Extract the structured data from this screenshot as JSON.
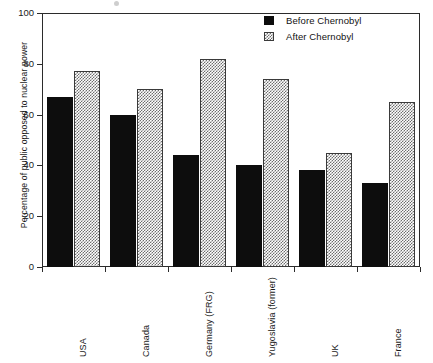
{
  "chart_data": {
    "type": "bar",
    "title": "",
    "xlabel": "",
    "ylabel": "Percentage of public opposed to nuclear power",
    "ylim": [
      0,
      100
    ],
    "yticks": [
      0,
      20,
      40,
      60,
      80,
      100
    ],
    "ytick_labels": [
      "0",
      "20",
      "40",
      "60",
      "80",
      "100"
    ],
    "grid": "horizontal dotted gridlines at 20, 40, 60, 80",
    "legend_position": "top-right inside plot area",
    "categories": [
      "USA",
      "Canada",
      "Germany (FRG)",
      "Yugoslavia (former)",
      "UK",
      "France"
    ],
    "series": [
      {
        "name": "Before Chernobyl",
        "fill": "solid-black",
        "color": "#0d0d0d",
        "values": [
          67,
          60,
          44,
          40,
          38,
          33
        ]
      },
      {
        "name": "After Chernobyl",
        "fill": "gray-checker-hatch",
        "color": "#6e6e6e",
        "values": [
          77,
          70,
          82,
          74,
          45,
          65
        ]
      }
    ]
  },
  "legend": {
    "items": [
      {
        "label": "Before Chernobyl",
        "style": "before"
      },
      {
        "label": "After Chernobyl",
        "style": "after"
      }
    ]
  },
  "axes": {
    "y_title": "Percentage of public opposed to nuclear power"
  }
}
